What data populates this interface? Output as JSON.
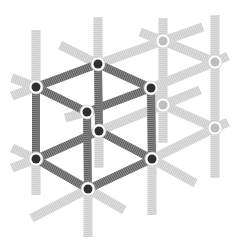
{
  "diagram": {
    "colors": {
      "background": "#ffffff",
      "dark_spring": "#6e6e6e",
      "light_spring": "#d4d4d4",
      "dark_node": "#2f2f2f",
      "light_node": "#bdbdbd",
      "node_ring": "#ffffff"
    },
    "dark_nodes": [
      {
        "id": "A",
        "x": 36,
        "y": 87
      },
      {
        "id": "B",
        "x": 98,
        "y": 64
      },
      {
        "id": "C",
        "x": 151,
        "y": 88
      },
      {
        "id": "D",
        "x": 87,
        "y": 112
      },
      {
        "id": "E",
        "x": 36,
        "y": 159
      },
      {
        "id": "F",
        "x": 99,
        "y": 131
      },
      {
        "id": "G",
        "x": 152,
        "y": 159
      },
      {
        "id": "H",
        "x": 88,
        "y": 189
      }
    ],
    "light_nodes": [
      {
        "id": "L1",
        "x": 163,
        "y": 41
      },
      {
        "id": "L2",
        "x": 215,
        "y": 62
      },
      {
        "id": "L3",
        "x": 163,
        "y": 105
      },
      {
        "id": "L4",
        "x": 215,
        "y": 128
      }
    ],
    "dark_springs": [
      {
        "from": [
          36,
          87
        ],
        "to": [
          98,
          64
        ]
      },
      {
        "from": [
          98,
          64
        ],
        "to": [
          151,
          88
        ]
      },
      {
        "from": [
          151,
          88
        ],
        "to": [
          87,
          112
        ]
      },
      {
        "from": [
          87,
          112
        ],
        "to": [
          36,
          87
        ]
      },
      {
        "from": [
          36,
          159
        ],
        "to": [
          99,
          131
        ]
      },
      {
        "from": [
          99,
          131
        ],
        "to": [
          152,
          159
        ]
      },
      {
        "from": [
          152,
          159
        ],
        "to": [
          88,
          189
        ]
      },
      {
        "from": [
          88,
          189
        ],
        "to": [
          36,
          159
        ]
      },
      {
        "from": [
          36,
          87
        ],
        "to": [
          36,
          159
        ]
      },
      {
        "from": [
          98,
          64
        ],
        "to": [
          99,
          131
        ]
      },
      {
        "from": [
          151,
          88
        ],
        "to": [
          152,
          159
        ]
      },
      {
        "from": [
          87,
          112
        ],
        "to": [
          88,
          189
        ]
      }
    ],
    "light_springs": [
      {
        "from": [
          36,
          30
        ],
        "to": [
          36,
          87
        ]
      },
      {
        "from": [
          36,
          159
        ],
        "to": [
          36,
          195
        ]
      },
      {
        "from": [
          98,
          17
        ],
        "to": [
          98,
          64
        ]
      },
      {
        "from": [
          99,
          131
        ],
        "to": [
          99,
          168
        ]
      },
      {
        "from": [
          163,
          18
        ],
        "to": [
          163,
          143
        ]
      },
      {
        "from": [
          215,
          15
        ],
        "to": [
          215,
          178
        ]
      },
      {
        "from": [
          151,
          88
        ],
        "to": [
          152,
          159
        ]
      },
      {
        "from": [
          152,
          159
        ],
        "to": [
          152,
          215
        ]
      },
      {
        "from": [
          88,
          189
        ],
        "to": [
          88,
          237
        ]
      },
      {
        "from": [
          98,
          64
        ],
        "to": [
          163,
          41
        ]
      },
      {
        "from": [
          163,
          41
        ],
        "to": [
          215,
          62
        ]
      },
      {
        "from": [
          151,
          88
        ],
        "to": [
          215,
          62
        ]
      },
      {
        "from": [
          151,
          88
        ],
        "to": [
          163,
          105
        ]
      },
      {
        "from": [
          99,
          131
        ],
        "to": [
          163,
          105
        ]
      },
      {
        "from": [
          163,
          105
        ],
        "to": [
          215,
          128
        ]
      },
      {
        "from": [
          152,
          159
        ],
        "to": [
          215,
          128
        ]
      },
      {
        "from": [
          163,
          41
        ],
        "to": [
          203,
          27
        ]
      },
      {
        "from": [
          140,
          32
        ],
        "to": [
          163,
          41
        ]
      },
      {
        "from": [
          60,
          45
        ],
        "to": [
          98,
          64
        ]
      },
      {
        "from": [
          215,
          62
        ],
        "to": [
          228,
          56
        ]
      },
      {
        "from": [
          215,
          128
        ],
        "to": [
          228,
          122
        ]
      },
      {
        "from": [
          87,
          112
        ],
        "to": [
          65,
          118
        ]
      },
      {
        "from": [
          163,
          105
        ],
        "to": [
          200,
          90
        ]
      },
      {
        "from": [
          36,
          87
        ],
        "to": [
          12,
          78
        ]
      },
      {
        "from": [
          36,
          87
        ],
        "to": [
          12,
          96
        ]
      },
      {
        "from": [
          36,
          159
        ],
        "to": [
          12,
          148
        ]
      },
      {
        "from": [
          36,
          159
        ],
        "to": [
          12,
          168
        ]
      },
      {
        "from": [
          88,
          189
        ],
        "to": [
          32,
          218
        ]
      },
      {
        "from": [
          88,
          189
        ],
        "to": [
          124,
          210
        ]
      },
      {
        "from": [
          152,
          159
        ],
        "to": [
          195,
          183
        ]
      }
    ]
  }
}
